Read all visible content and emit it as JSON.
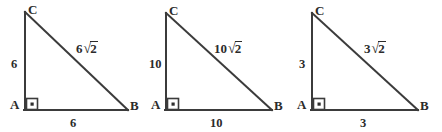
{
  "figure": {
    "width": 442,
    "height": 132,
    "background_color": "#ffffff",
    "line_color": "#3b3b3b",
    "text_color": "#2b2b2b"
  },
  "triangles": [
    {
      "id": "triangle-1",
      "vertex_a": "A",
      "vertex_b": "B",
      "vertex_c": "C",
      "leg_vertical": "6",
      "leg_horizontal": "6",
      "hypotenuse_coefficient": "6",
      "hypotenuse_radicand": "2",
      "right_angle_at": "A"
    },
    {
      "id": "triangle-2",
      "vertex_a": "A",
      "vertex_b": "B",
      "vertex_c": "C",
      "leg_vertical": "10",
      "leg_horizontal": "10",
      "hypotenuse_coefficient": "10",
      "hypotenuse_radicand": "2",
      "right_angle_at": "A"
    },
    {
      "id": "triangle-3",
      "vertex_a": "A",
      "vertex_b": "B",
      "vertex_c": "C",
      "leg_vertical": "3",
      "leg_horizontal": "3",
      "hypotenuse_coefficient": "3",
      "hypotenuse_radicand": "2",
      "right_angle_at": "A"
    }
  ],
  "radical_sign": "√"
}
